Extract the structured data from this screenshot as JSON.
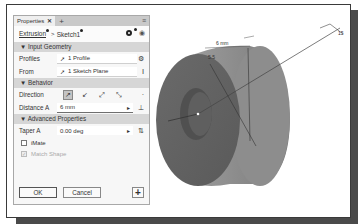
{
  "panel": {
    "tab_label": "Properties",
    "tab_close": "✕",
    "tab_add": "+",
    "tab_menu": "≡",
    "breadcrumb": {
      "item1": "Extrusion",
      "separator": ">",
      "item2": "Sketch1"
    },
    "sections": {
      "input_geometry": "▼ Input Geometry",
      "behavior": "▼ Behavior",
      "advanced": "▼ Advanced Properties"
    },
    "profiles": {
      "label": "Profiles",
      "value": "1 Profile"
    },
    "from": {
      "label": "From",
      "value": "1 Sketch Plane"
    },
    "direction": {
      "label": "Direction"
    },
    "distance_a": {
      "label": "Distance A",
      "value": "6 mm"
    },
    "taper_a": {
      "label": "Taper A",
      "value": "0.00 deg"
    },
    "imate": {
      "label": "iMate",
      "checked": false
    },
    "match_shape": {
      "label": "Match Shape",
      "checked": true,
      "disabled": true
    },
    "ok_label": "OK",
    "cancel_label": "Cancel",
    "plus_label": "+"
  },
  "viewport": {
    "dim_distance": "6 mm",
    "dim_small": "5.5",
    "dim_leader": "15",
    "colors": {
      "part_dark": "#6b6b6b",
      "part_mid": "#8a8a8a",
      "part_light": "#a5a5a5"
    }
  }
}
